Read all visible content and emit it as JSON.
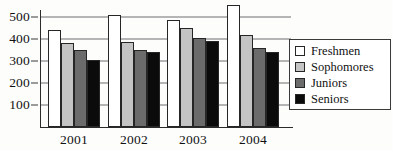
{
  "chart_data": {
    "type": "bar",
    "title": "",
    "xlabel": "",
    "ylabel": "",
    "categories": [
      "2001",
      "2002",
      "2003",
      "2004"
    ],
    "series": [
      {
        "name": "Freshmen",
        "color": "#ffffff",
        "values": [
          440,
          510,
          485,
          555
        ]
      },
      {
        "name": "Sophomores",
        "color": "#c4c4c4",
        "values": [
          380,
          385,
          450,
          420
        ]
      },
      {
        "name": "Juniors",
        "color": "#6b6b6b",
        "values": [
          350,
          350,
          405,
          360
        ]
      },
      {
        "name": "Seniors",
        "color": "#0b0b0b",
        "values": [
          305,
          340,
          390,
          340
        ]
      }
    ],
    "ylim": [
      0,
      560
    ],
    "yticks": [
      100,
      200,
      300,
      400,
      500
    ],
    "ytick_labels": [
      "100",
      "200",
      "300",
      "400",
      "500"
    ],
    "grid": true,
    "legend_position": "right"
  },
  "legend": {
    "entries": [
      {
        "label": "Freshmen"
      },
      {
        "label": "Sophomores"
      },
      {
        "label": "Juniors"
      },
      {
        "label": "Seniors"
      }
    ]
  },
  "axis": {
    "y_tick_labels": [
      "500",
      "400",
      "300",
      "200",
      "100"
    ],
    "x_tick_labels": [
      "2001",
      "2002",
      "2003",
      "2004"
    ]
  }
}
